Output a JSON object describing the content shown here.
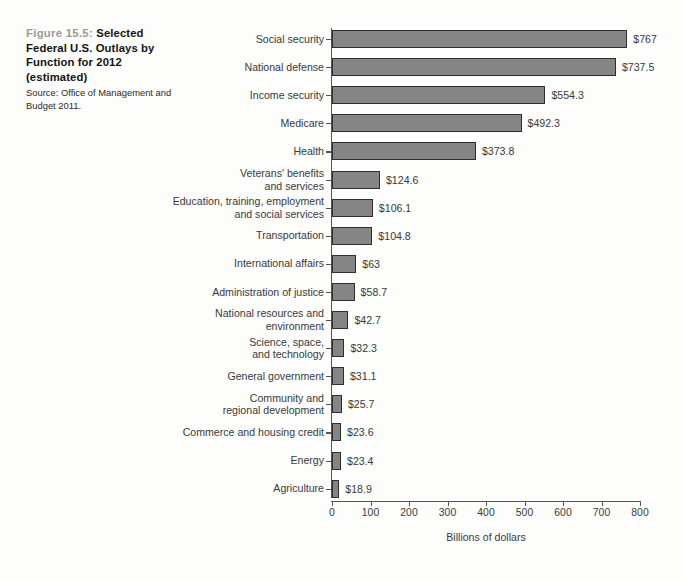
{
  "caption": {
    "figure_number": "Figure 15.5:",
    "title": "Selected Federal U.S. Outlays by Function for 2012 (estimated)",
    "title_line1": "Selected",
    "title_line2": "Federal U.S. Outlays",
    "title_line3": "by Function for 2012",
    "title_line4": "(estimated)",
    "source": "Source: Office of Management and Budget 2011.",
    "figure_number_color": "#9a9a9a",
    "title_color": "#141414"
  },
  "chart_data": {
    "type": "bar",
    "orientation": "horizontal",
    "title": "Selected Federal U.S. Outlays by Function for 2012 (estimated)",
    "xlabel": "Billions of dollars",
    "ylabel": "",
    "xlim": [
      0,
      800
    ],
    "xticks": [
      0,
      100,
      200,
      300,
      400,
      500,
      600,
      700,
      800
    ],
    "xtick_labels": [
      "0",
      "100",
      "200",
      "300",
      "400",
      "500",
      "600",
      "700",
      "800"
    ],
    "grid": false,
    "legend": null,
    "bar_color": "#858585",
    "bar_edge_color": "#2e2e2e",
    "categories": [
      "Social security",
      "National defense",
      "Income security",
      "Medicare",
      "Health",
      "Veterans' benefits\nand services",
      "Education, training, employment\nand social services",
      "Transportation",
      "International affairs",
      "Administration of justice",
      "National resources and\nenvironment",
      "Science, space,\nand technology",
      "General government",
      "Community and\nregional development",
      "Commerce and housing credit",
      "Energy",
      "Agriculture"
    ],
    "values": [
      767,
      737.5,
      554.3,
      492.3,
      373.8,
      124.6,
      106.1,
      104.8,
      63,
      58.7,
      42.7,
      32.3,
      31.1,
      25.7,
      23.6,
      23.4,
      18.9
    ],
    "value_labels": [
      "$767",
      "$737.5",
      "$554.3",
      "$492.3",
      "$373.8",
      "$124.6",
      "$106.1",
      "$104.8",
      "$63",
      "$58.7",
      "$42.7",
      "$32.3",
      "$31.1",
      "$25.7",
      "$23.6",
      "$23.4",
      "$18.9"
    ]
  }
}
